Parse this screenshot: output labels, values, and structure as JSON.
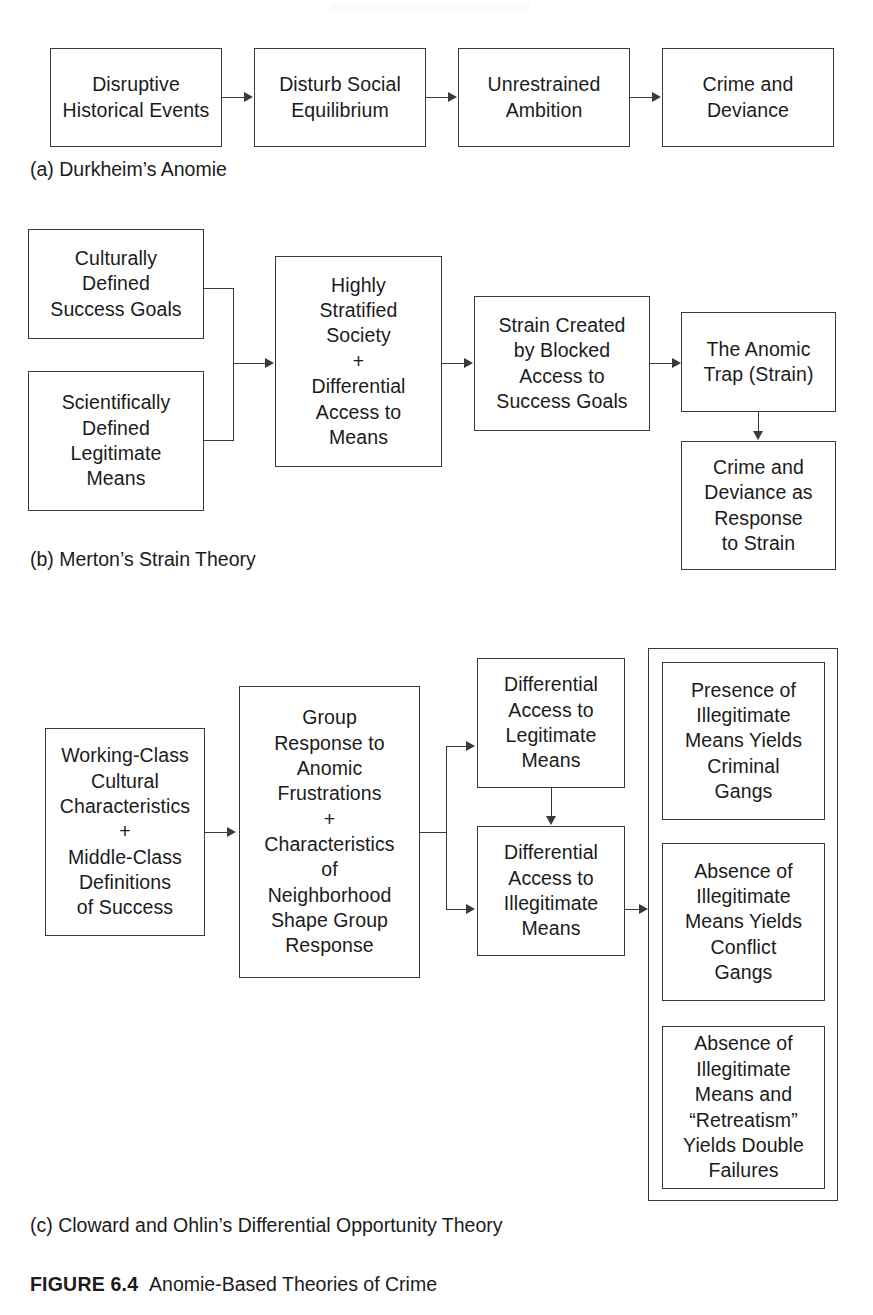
{
  "figure": {
    "lead": "FIGURE 6.4",
    "title": "Anomie-Based Theories of Crime"
  },
  "panels": [
    {
      "id": "a",
      "caption": "(a) Durkheim’s Anomie",
      "boxes": [
        {
          "id": "a1",
          "text": "Disruptive\nHistorical Events"
        },
        {
          "id": "a2",
          "text": "Disturb Social\nEquilibrium"
        },
        {
          "id": "a3",
          "text": "Unrestrained\nAmbition"
        },
        {
          "id": "a4",
          "text": "Crime and\nDeviance"
        }
      ]
    },
    {
      "id": "b",
      "caption": "(b) Merton’s Strain Theory",
      "boxes": [
        {
          "id": "b1",
          "text": "Culturally\nDefined\nSuccess Goals"
        },
        {
          "id": "b2",
          "text": "Scientifically\nDefined\nLegitimate\nMeans"
        },
        {
          "id": "b3",
          "text": "Highly\nStratified\nSociety\n+\nDifferential\nAccess to\nMeans"
        },
        {
          "id": "b4",
          "text": "Strain Created\nby Blocked\nAccess to\nSuccess Goals"
        },
        {
          "id": "b5",
          "text": "The Anomic\nTrap (Strain)"
        },
        {
          "id": "b6",
          "text": "Crime and\nDeviance as\nResponse\nto Strain"
        }
      ]
    },
    {
      "id": "c",
      "caption": "(c) Cloward and Ohlin’s Differential Opportunity Theory",
      "boxes": [
        {
          "id": "c1",
          "text": "Working-Class\nCultural\nCharacteristics\n+\nMiddle-Class\nDefinitions\nof Success"
        },
        {
          "id": "c2",
          "text": "Group\nResponse to\nAnomic\nFrustrations\n+\nCharacteristics\nof\nNeighborhood\nShape Group\nResponse"
        },
        {
          "id": "c3",
          "text": "Differential\nAccess to\nLegitimate\nMeans"
        },
        {
          "id": "c4",
          "text": "Differential\nAccess to\nIllegitimate\nMeans"
        },
        {
          "id": "c5",
          "text": "Presence of\nIllegitimate\nMeans Yields\nCriminal\nGangs"
        },
        {
          "id": "c6",
          "text": "Absence of\nIllegitimate\nMeans Yields\nConflict\nGangs"
        },
        {
          "id": "c7",
          "text": "Absence of\nIllegitimate\nMeans and\n“Retreatism”\nYields Double\nFailures"
        }
      ]
    }
  ],
  "colors": {
    "stroke": "#3a3a3a",
    "text": "#1b1b1b",
    "background": "#ffffff"
  }
}
